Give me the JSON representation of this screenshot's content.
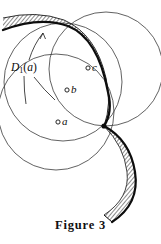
{
  "figure": {
    "caption": "Figure  3",
    "annotation": {
      "name": "D",
      "subscript": "1",
      "open_paren": "(",
      "argument": "a",
      "close_paren": ")",
      "full_text": "D1(a)"
    },
    "points": [
      {
        "id": "c",
        "label": "c",
        "marker": "open-circle",
        "cx": 88,
        "cy": 68
      },
      {
        "id": "b",
        "label": "b",
        "marker": "open-circle",
        "cx": 67,
        "cy": 90
      },
      {
        "id": "a",
        "label": "a",
        "marker": "open-circle",
        "cx": 58,
        "cy": 122
      }
    ],
    "colors": {
      "stroke": "#1a1a1a",
      "thin_stroke": "#2b2b2b",
      "hatch": "#3d3d3d",
      "background": "#ffffff",
      "text": "#0d0d0d"
    },
    "geometry": {
      "common_tangency_point": {
        "x": 104,
        "y": 126
      },
      "circles": [
        {
          "id": "disk-c",
          "center": {
            "x": 106,
            "y": 69
          },
          "r": 57
        },
        {
          "id": "disk-b",
          "center": {
            "x": 63,
            "y": 82
          },
          "r": 59
        },
        {
          "id": "disk-a",
          "center": {
            "x": 56,
            "y": 112
          },
          "r": 58
        }
      ],
      "hatched_arcs": [
        {
          "id": "upper-hatched-band",
          "description": "thick hatched arc sweeping from upper-left edge down to tangency point"
        },
        {
          "id": "lower-hatched-band",
          "description": "thick hatched arc sweeping from tangency point down to lower-right"
        }
      ]
    }
  }
}
